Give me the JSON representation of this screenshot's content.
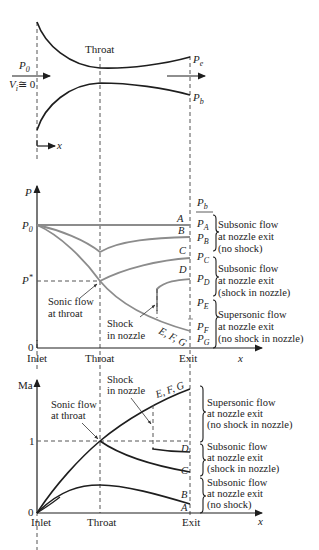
{
  "figure": {
    "colors": {
      "line_black": "#1e1e1e",
      "line_gray": "#8c8c8c",
      "text": "#222222"
    }
  },
  "nozzle": {
    "throat_label": "Throat",
    "inlet_pressure": "P",
    "inlet_pressure_sub": "0",
    "inlet_velocity": "V",
    "inlet_velocity_sub": "i",
    "inlet_velocity_rel": "≅ 0",
    "exit_pressure": "P",
    "exit_pressure_sub": "e",
    "back_pressure": "P",
    "back_pressure_sub": "b",
    "x_axis": "x"
  },
  "pressure_chart": {
    "y_axis": "P",
    "x_axis": "x",
    "ticks_y": {
      "p0": "P",
      "p0_sub": "0",
      "pstar": "P",
      "pstar_sup": "*",
      "zero": "0"
    },
    "ticks_x": [
      "Inlet",
      "Throat",
      "Exit"
    ],
    "back_pressure_header": "P",
    "back_pressure_header_sub": "b",
    "curve_labels": [
      "A",
      "B",
      "C",
      "D",
      "E, F, G"
    ],
    "exit_pressures": [
      {
        "p": "P",
        "sub": "A"
      },
      {
        "p": "P",
        "sub": "B"
      },
      {
        "p": "P",
        "sub": "C"
      },
      {
        "p": "P",
        "sub": "D"
      },
      {
        "p": "P",
        "sub": "E"
      },
      {
        "p": "P",
        "sub": "F"
      },
      {
        "p": "P",
        "sub": "G"
      }
    ],
    "annotations": {
      "sonic_line1": "Sonic flow",
      "sonic_line2": "at throat",
      "shock_line1": "Shock",
      "shock_line2": "in nozzle"
    },
    "regions": [
      {
        "line1": "Subsonic flow",
        "line2": "at nozzle exit",
        "line3": "(no shock)"
      },
      {
        "line1": "Subsonic flow",
        "line2": "at nozzle exit",
        "line3": "(shock in nozzle)"
      },
      {
        "line1": "Supersonic flow",
        "line2": "at nozzle exit",
        "line3": "(no shock in nozzle)"
      }
    ]
  },
  "mach_chart": {
    "y_axis": "Ma",
    "x_axis": "x",
    "ticks_y": {
      "one": "1",
      "zero": "0"
    },
    "ticks_x": [
      "Inlet",
      "Throat",
      "Exit"
    ],
    "curve_labels": [
      "E, F, G",
      "D",
      "C",
      "B",
      "A"
    ],
    "annotations": {
      "sonic_line1": "Sonic flow",
      "sonic_line2": "at throat",
      "shock_line1": "Shock",
      "shock_line2": "in nozzle"
    },
    "regions": [
      {
        "line1": "Supersonic flow",
        "line2": "at nozzle exit",
        "line3": "(no shock in nozzle)"
      },
      {
        "line1": "Subsonic flow",
        "line2": "at nozzle exit",
        "line3": "(shock in nozzle)"
      },
      {
        "line1": "Subsonic flow",
        "line2": "at nozzle exit",
        "line3": "(no shock)"
      }
    ]
  }
}
